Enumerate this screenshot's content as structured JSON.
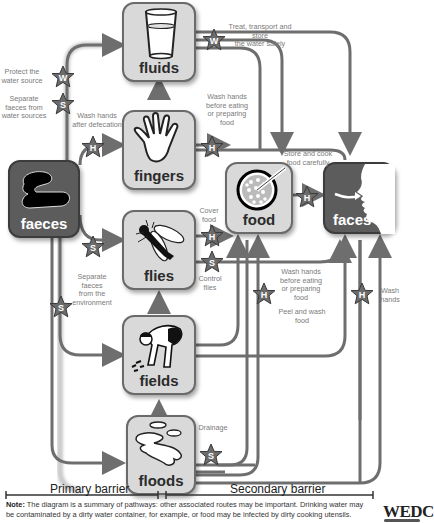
{
  "diagram": {
    "nodes": {
      "fluids": "fluids",
      "fingers": "fingers",
      "faeces": "faeces",
      "flies": "flies",
      "fields": "fields",
      "floods": "floods",
      "food": "food",
      "faces": "faces"
    },
    "barrier_markers": {
      "W": "W",
      "S": "S",
      "H": "H"
    },
    "annotations": {
      "protect_water_source": [
        "Protect the",
        "water source"
      ],
      "separate_faeces_water": [
        "Separate",
        "faeces from",
        "water sources"
      ],
      "wash_after_defecation": [
        "Wash hands",
        "after defecation"
      ],
      "treat_transport_store": [
        "Treat, transport and store",
        "the water safely"
      ],
      "wash_before_eating_top": [
        "Wash hands",
        "before eating",
        "or preparing",
        "food"
      ],
      "store_cook": [
        "Store and cook",
        "food carefully"
      ],
      "cover_food": [
        "Cover",
        "food"
      ],
      "control_flies": [
        "Control",
        "flies"
      ],
      "separate_faeces_env": [
        "Separate faeces",
        "from the",
        "environment"
      ],
      "wash_before_eating_mid": [
        "Wash hands",
        "before eating",
        "or preparing",
        "food"
      ],
      "peel_wash": [
        "Peel and wash",
        "food"
      ],
      "wash_hands": [
        "Wash",
        "hands"
      ],
      "drainage": [
        "Drainage"
      ]
    },
    "barriers": {
      "primary": "Primary barrier",
      "secondary": "Secondary barrier"
    },
    "note": {
      "prefix": "Note:",
      "text": " The diagram is a summary of pathways: other associated routes may be important. Drinking water may be contaminated by a dirty water container, for example, or food may be infected by dirty cooking utensils."
    },
    "logo": "WEDC",
    "colors": {
      "node_fill": "#d9d9d9",
      "node_dark": "#5c5c5c",
      "arrow": "#6e6e6e",
      "star": "#6b6b6b",
      "label": "#7a7a7a"
    }
  }
}
